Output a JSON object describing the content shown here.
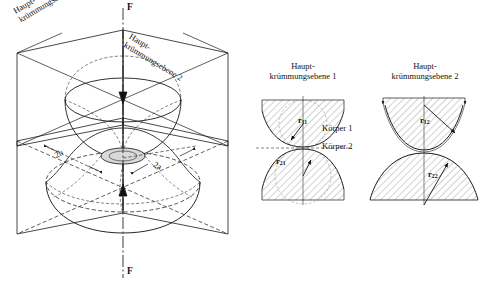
{
  "figure": {
    "title_3d_plane1": "Haupt-\nkrümmungsebene 1",
    "plane1_line1": "Haupt-",
    "plane1_line2": "krümmungsebene 1",
    "plane2_line1": "Haupt-",
    "plane2_line2": "krümmungsebene 2",
    "force_top": "F",
    "force_bottom": "F",
    "semi_axis_b": "2b",
    "semi_axis_a": "2a"
  },
  "detail_left": {
    "heading_line1": "Haupt-",
    "heading_line2": "krümmungsebene 1",
    "radius_body1": "r",
    "radius_body1_sub": "11",
    "radius_body2": "r",
    "radius_body2_sub": "21"
  },
  "detail_right": {
    "heading_line1": "Haupt-",
    "heading_line2": "krümmungsebene 2",
    "radius_body1": "r",
    "radius_body1_sub": "12",
    "radius_body2": "r",
    "radius_body2_sub": "22"
  },
  "bodies": {
    "body1_label": "Körper 1",
    "body2_label": "Körper 2"
  },
  "colors": {
    "stroke": "#1a1a1a",
    "hatch": "#555555",
    "background": "#ffffff",
    "fill_light": "#d8d8d8"
  }
}
